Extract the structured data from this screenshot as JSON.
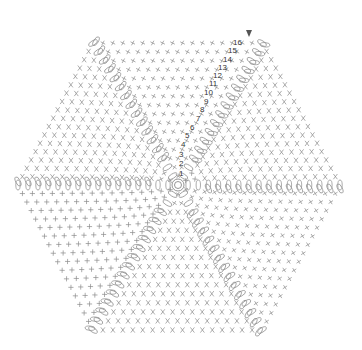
{
  "diagram": {
    "type": "crochet-chart",
    "shape": "hexagon",
    "center": [
      178,
      185
    ],
    "vertices": [
      [
        93,
        43
      ],
      [
        262,
        43
      ],
      [
        340,
        185
      ],
      [
        262,
        330
      ],
      [
        93,
        330
      ],
      [
        18,
        185
      ]
    ],
    "wedges": 6,
    "rounds": 16,
    "stitch_color": "#8a8a8a",
    "label_color": "#333333",
    "background": "#ffffff",
    "legend_stitch_types": [
      "single-crochet-plus",
      "single-crochet-x",
      "chain-loop",
      "magic-ring"
    ]
  },
  "row_labels": [
    {
      "text": "1",
      "x": 179,
      "y": 176
    },
    {
      "text": "2",
      "x": 179,
      "y": 166
    },
    {
      "text": "3",
      "x": 179,
      "y": 157
    },
    {
      "text": "4",
      "x": 181,
      "y": 147
    },
    {
      "text": "5",
      "x": 185,
      "y": 138
    },
    {
      "text": "6",
      "x": 190,
      "y": 130
    },
    {
      "text": "7",
      "x": 196,
      "y": 121
    },
    {
      "text": "8",
      "x": 200,
      "y": 112
    },
    {
      "text": "9",
      "x": 204,
      "y": 104
    },
    {
      "text": "10",
      "x": 204,
      "y": 95
    },
    {
      "text": "11",
      "x": 209,
      "y": 86
    },
    {
      "text": "12",
      "x": 213,
      "y": 78
    },
    {
      "text": "13",
      "x": 218,
      "y": 70
    },
    {
      "text": "14",
      "x": 223,
      "y": 62
    },
    {
      "text": "15",
      "x": 228,
      "y": 53
    },
    {
      "text": "16",
      "x": 233,
      "y": 45
    }
  ],
  "start_arrow": {
    "x": 249,
    "y": 33,
    "direction": "down"
  }
}
